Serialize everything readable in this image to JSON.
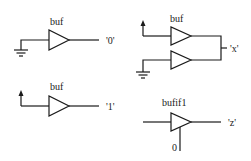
{
  "diagram": {
    "gates": [
      {
        "id": "buf-ground",
        "type": "buf",
        "label": "buf",
        "input": "ground",
        "output_label": "'0'"
      },
      {
        "id": "buf-contention",
        "type": "buf",
        "label": "buf",
        "inputs": [
          "supply",
          "ground"
        ],
        "output_label": "'x'"
      },
      {
        "id": "buf-supply",
        "type": "buf",
        "label": "buf",
        "input": "supply",
        "output_label": "'1'"
      },
      {
        "id": "bufif1-disabled",
        "type": "bufif1",
        "label": "bufif1",
        "control_value": "0",
        "output_label": "'z'"
      }
    ],
    "colors": {
      "line": "#1a1a1a",
      "background": "#ffffff"
    }
  }
}
